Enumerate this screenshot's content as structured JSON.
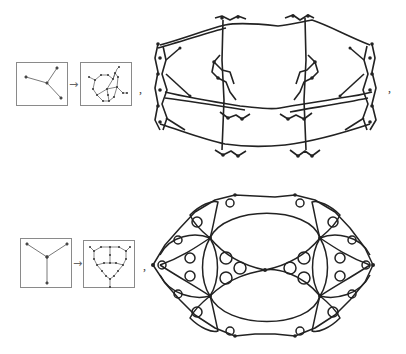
{
  "figure": {
    "rows": [
      {
        "id": "row-1",
        "seed_graph": "tree with 3 leaves (asymmetric)",
        "rule_graph": "subdivided cubic graph",
        "arrow_symbol": "→",
        "separator_after_rule": ",",
        "separator_after_result": ",",
        "result": "torus-like cubic lattice network"
      },
      {
        "id": "row-2",
        "seed_graph": "symmetric tripod tree",
        "rule_graph": "subdivided cubic graph (symmetric)",
        "arrow_symbol": "→",
        "separator_after_rule": ",",
        "result": "Apollonian-like fractal network"
      }
    ],
    "colors": {
      "background": "#ffffff",
      "line": "#222222",
      "box_border": "#8a8a8a",
      "node": "#333333"
    }
  }
}
